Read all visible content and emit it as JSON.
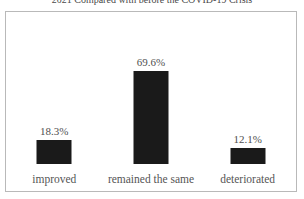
{
  "chart_data": {
    "type": "bar",
    "title": "2021 Compared with before the COVID-19 Crisis",
    "categories": [
      "improved",
      "remained the same",
      "deteriorated"
    ],
    "values": [
      18.3,
      69.6,
      12.1
    ],
    "value_labels": [
      "18.3%",
      "69.6%",
      "12.1%"
    ],
    "xlabel": "",
    "ylabel": "",
    "ylim": [
      0,
      100
    ],
    "grid": false,
    "legend": "none",
    "bar_color": "#1a1a1a",
    "frame_color": "#b9b9b9",
    "background_color": "#ffffff",
    "label_color": "#555555"
  }
}
